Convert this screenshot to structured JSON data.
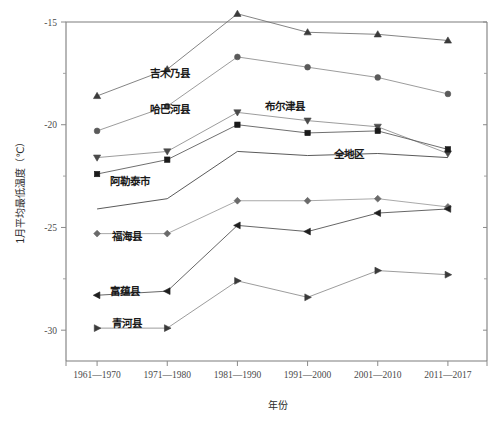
{
  "chart_data": {
    "type": "line",
    "title": "",
    "xlabel": "年份",
    "ylabel": "1月平均最低温度（℃）",
    "categories": [
      "1961—1970",
      "1971—1980",
      "1981—1990",
      "1991—2000",
      "2001—2010",
      "2011—2017"
    ],
    "ylim": [
      -31.5,
      -15.0
    ],
    "yticks": [
      -15,
      -20,
      -25,
      -30
    ],
    "ytick_labels": [
      "-15",
      "-20",
      "-25",
      "-30"
    ],
    "yminor_ticks": [
      -17.5,
      -22.5,
      -27.5
    ],
    "grid": false,
    "legend": "inline-labels",
    "series": [
      {
        "name": "吉木乃县",
        "marker": "triangle-up",
        "color": "#3a3a3a",
        "line_color": "#6e6e6e",
        "values": [
          -18.6,
          -17.3,
          -14.6,
          -15.5,
          -15.6,
          -15.9
        ],
        "label_x": 150,
        "label_y": 77
      },
      {
        "name": "哈巴河县",
        "marker": "circle",
        "color": "#5a5a5a",
        "line_color": "#8a8a8a",
        "values": [
          -20.3,
          -19.1,
          -16.7,
          -17.2,
          -17.7,
          -18.5
        ],
        "label_x": 150,
        "label_y": 113
      },
      {
        "name": "布尔津县",
        "marker": "triangle-down",
        "color": "#4a4a4a",
        "line_color": "#8a8a8a",
        "values": [
          -21.6,
          -21.3,
          -19.4,
          -19.8,
          -20.1,
          -21.4
        ],
        "label_x": 265,
        "label_y": 110
      },
      {
        "name": "阿勒泰市",
        "marker": "square",
        "color": "#1a1a1a",
        "line_color": "#555555",
        "values": [
          -22.4,
          -21.7,
          -20.0,
          -20.4,
          -20.3,
          -21.2
        ],
        "label_x": 110,
        "label_y": 185
      },
      {
        "name": "全地区",
        "marker": "none",
        "color": "#2a2a2a",
        "line_color": "#3c3c3c",
        "values": [
          -24.1,
          -23.6,
          -21.3,
          -21.5,
          -21.4,
          -21.6
        ],
        "label_x": 334,
        "label_y": 158
      },
      {
        "name": "福海县",
        "marker": "diamond",
        "color": "#6a6a6a",
        "line_color": "#9a9a9a",
        "values": [
          -25.3,
          -25.3,
          -23.7,
          -23.7,
          -23.6,
          -24.0
        ],
        "label_x": 112,
        "label_y": 240
      },
      {
        "name": "富蕴县",
        "marker": "triangle-left",
        "color": "#1f1f1f",
        "line_color": "#4a4a4a",
        "values": [
          -28.3,
          -28.1,
          -24.9,
          -25.2,
          -24.3,
          -24.1
        ],
        "label_x": 110,
        "label_y": 295
      },
      {
        "name": "青河县",
        "marker": "triangle-right",
        "color": "#3a3a3a",
        "line_color": "#8a8a8a",
        "values": [
          -29.9,
          -29.9,
          -27.6,
          -28.4,
          -27.1,
          -27.3
        ],
        "label_x": 112,
        "label_y": 327
      }
    ]
  },
  "axes": {
    "y_axis_title": "1月平均最低温度（℃）",
    "x_axis_title": "年份"
  }
}
